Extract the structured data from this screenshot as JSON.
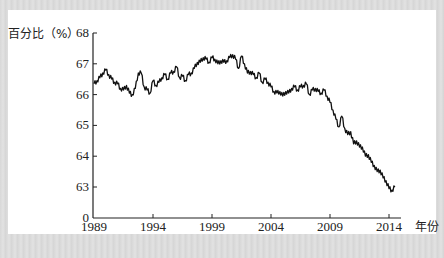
{
  "chart_data": {
    "type": "line",
    "title": "",
    "ylabel": "百分比（%）",
    "xlabel": "年份",
    "y_ticks": [
      "68",
      "67",
      "66",
      "65",
      "64",
      "63",
      "0"
    ],
    "x_ticks": [
      "1989",
      "1994",
      "1999",
      "2004",
      "2009",
      "2014"
    ],
    "ylim": [
      62.5,
      68
    ],
    "y_axis_break": "broken axis: 0 then 63-68",
    "grid": false,
    "legend": "none",
    "series": [
      {
        "name": "百分比",
        "x": [
          1989.0,
          1989.25,
          1989.5,
          1989.75,
          1990.0,
          1990.25,
          1990.5,
          1990.75,
          1991.0,
          1991.25,
          1991.5,
          1991.75,
          1992.0,
          1992.25,
          1992.5,
          1992.75,
          1993.0,
          1993.25,
          1993.5,
          1993.75,
          1994.0,
          1994.25,
          1994.5,
          1994.75,
          1995.0,
          1995.25,
          1995.5,
          1995.75,
          1996.0,
          1996.25,
          1996.5,
          1996.75,
          1997.0,
          1997.25,
          1997.5,
          1997.75,
          1998.0,
          1998.25,
          1998.5,
          1998.75,
          1999.0,
          1999.25,
          1999.5,
          1999.75,
          2000.0,
          2000.25,
          2000.5,
          2000.75,
          2001.0,
          2001.25,
          2001.5,
          2001.75,
          2002.0,
          2002.25,
          2002.5,
          2002.75,
          2003.0,
          2003.25,
          2003.5,
          2003.75,
          2004.0,
          2004.25,
          2004.5,
          2004.75,
          2005.0,
          2005.25,
          2005.5,
          2005.75,
          2006.0,
          2006.25,
          2006.5,
          2006.75,
          2007.0,
          2007.25,
          2007.5,
          2007.75,
          2008.0,
          2008.25,
          2008.5,
          2008.75,
          2009.0,
          2009.25,
          2009.5,
          2009.75,
          2010.0,
          2010.25,
          2010.5,
          2010.75,
          2011.0,
          2011.25,
          2011.5,
          2011.75,
          2012.0,
          2012.25,
          2012.5,
          2012.75,
          2013.0,
          2013.25,
          2013.5,
          2013.75,
          2014.0,
          2014.25,
          2014.5
        ],
        "values": [
          66.35,
          66.45,
          66.55,
          66.7,
          66.8,
          66.65,
          66.5,
          66.4,
          66.35,
          66.2,
          66.15,
          66.3,
          66.05,
          66.0,
          66.2,
          66.7,
          66.7,
          66.25,
          66.15,
          66.05,
          66.45,
          66.3,
          66.4,
          66.55,
          66.65,
          66.5,
          66.7,
          66.75,
          66.9,
          66.55,
          66.6,
          66.45,
          66.65,
          66.7,
          66.85,
          67.05,
          67.05,
          67.2,
          67.15,
          67.05,
          67.2,
          67.15,
          67.0,
          67.1,
          67.05,
          67.1,
          67.2,
          67.3,
          67.15,
          66.85,
          67.25,
          67.0,
          66.7,
          66.75,
          66.65,
          66.55,
          66.7,
          66.4,
          66.5,
          66.4,
          66.25,
          66.1,
          66.05,
          66.1,
          65.95,
          66.1,
          66.05,
          66.2,
          66.25,
          66.15,
          66.25,
          66.3,
          66.35,
          66.0,
          66.15,
          66.2,
          66.1,
          66.05,
          66.15,
          65.95,
          65.75,
          65.5,
          65.2,
          64.95,
          65.3,
          64.9,
          64.7,
          64.8,
          64.4,
          64.5,
          64.3,
          64.3,
          64.0,
          64.05,
          63.8,
          63.7,
          63.5,
          63.55,
          63.3,
          63.2,
          62.95,
          62.9,
          63.0
        ]
      }
    ]
  },
  "axes": {
    "y_title": "百分比（%）",
    "x_title": "年份"
  }
}
